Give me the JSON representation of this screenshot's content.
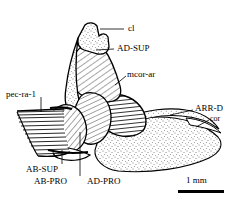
{
  "figure": {
    "type": "anatomical-line-drawing",
    "background_color": "#ffffff",
    "ink_color": "#000000"
  },
  "labels": [
    {
      "id": "cl",
      "text": "cl",
      "x": 128,
      "y": 25,
      "meaning": "cleithrum"
    },
    {
      "id": "ad-sup",
      "text": "AD-SUP",
      "x": 117,
      "y": 45,
      "meaning": "adductor superficialis"
    },
    {
      "id": "mcor-ar",
      "text": "mcor-ar",
      "x": 127,
      "y": 72,
      "meaning": "musculus coracoarcualis"
    },
    {
      "id": "arr-d",
      "text": "ARR-D",
      "x": 196,
      "y": 106,
      "meaning": "arrector dorsalis"
    },
    {
      "id": "cor",
      "text": "cor",
      "x": 211,
      "y": 117,
      "meaning": "coracoid"
    },
    {
      "id": "pec-ra-1",
      "text": "pec-ra-1",
      "x": 8,
      "y": 92,
      "meaning": "pectoral ray 1"
    },
    {
      "id": "ab-sup",
      "text": "AB-SUP",
      "x": 27,
      "y": 166,
      "meaning": "abductor superficialis"
    },
    {
      "id": "ab-pro",
      "text": "AB-PRO",
      "x": 35,
      "y": 178,
      "meaning": "abductor profundus"
    },
    {
      "id": "ad-pro",
      "text": "AD-PRO",
      "x": 88,
      "y": 178,
      "meaning": "adductor profundus"
    }
  ],
  "scale_bar": {
    "text": "1 mm",
    "x": 182,
    "y": 177,
    "bar_x": 178,
    "bar_y": 192,
    "bar_width": 46
  },
  "structures": [
    {
      "name": "cleithrum",
      "fill": "stipple",
      "label_ref": "cl"
    },
    {
      "name": "adductor-superficialis",
      "fill": "diagonal-hatch",
      "label_ref": "ad-sup"
    },
    {
      "name": "musculus-coracoarcualis",
      "fill": "horizontal-hatch",
      "label_ref": "mcor-ar"
    },
    {
      "name": "arrector-dorsalis",
      "fill": "stipple",
      "label_ref": "arr-d"
    },
    {
      "name": "coracoid",
      "fill": "stipple",
      "label_ref": "cor"
    },
    {
      "name": "pectoral-ray-1",
      "fill": "parallel-rays",
      "label_ref": "pec-ra-1"
    },
    {
      "name": "abductor-superficialis",
      "fill": "diagonal-hatch",
      "label_ref": "ab-sup"
    },
    {
      "name": "abductor-profundus",
      "fill": "blank",
      "label_ref": "ab-pro"
    },
    {
      "name": "adductor-profundus",
      "fill": "diagonal-hatch",
      "label_ref": "ad-pro"
    }
  ]
}
